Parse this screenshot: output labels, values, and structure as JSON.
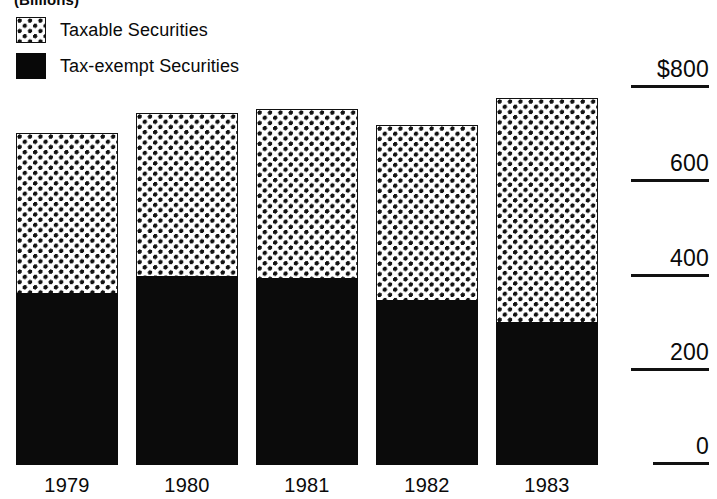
{
  "caption": "(Billions)",
  "legend": {
    "items": [
      {
        "key": "taxable",
        "label": "Taxable Securities",
        "swatch": "checker-swatch",
        "color": "#111111"
      },
      {
        "key": "exempt",
        "label": "Tax-exempt Securities",
        "swatch": "solid-black-swatch",
        "color": "#0b0b0b"
      }
    ]
  },
  "axis": {
    "ticks": [
      {
        "label": "$800",
        "value": 800
      },
      {
        "label": "600",
        "value": 600
      },
      {
        "label": "400",
        "value": 400
      },
      {
        "label": "200",
        "value": 200
      },
      {
        "label": "0",
        "value": 0
      }
    ]
  },
  "chart_data": {
    "type": "bar",
    "stacked": true,
    "title": "(Billions)",
    "xlabel": "",
    "ylabel": "(Billions)",
    "ylim": [
      0,
      800
    ],
    "yticks": [
      0,
      200,
      400,
      600,
      800
    ],
    "ytick_labels": [
      "0",
      "200",
      "400",
      "600",
      "$800"
    ],
    "grid": false,
    "legend_position": "top-left",
    "categories": [
      "1979",
      "1980",
      "1981",
      "1982",
      "1983"
    ],
    "series": [
      {
        "name": "Tax-exempt Securities",
        "values": [
          365,
          401,
          397,
          350,
          303
        ]
      },
      {
        "name": "Taxable Securities",
        "values": [
          339,
          346,
          358,
          371,
          475
        ]
      }
    ],
    "totals": [
      704,
      747,
      755,
      721,
      778
    ]
  }
}
